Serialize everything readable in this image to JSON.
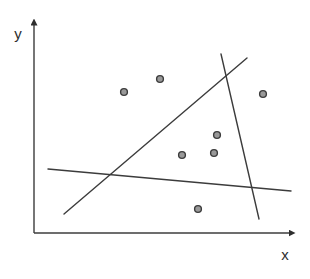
{
  "figure": {
    "background": "#ffffff",
    "line_color": "#3c3c3c",
    "line_width": 1.4,
    "axis_width": 1.4,
    "point_fill": "#999999",
    "point_stroke": "#3c3c3c",
    "point_stroke_width": 1.4,
    "point_radius": 3.4,
    "axes": {
      "x_label": "x",
      "y_label": "y",
      "origin": {
        "x": 34,
        "y": 233
      },
      "x_axis_end": {
        "x": 292,
        "y": 233
      },
      "y_axis_end": {
        "x": 34,
        "y": 22
      }
    },
    "points_px": [
      [
        124,
        92
      ],
      [
        160,
        79
      ],
      [
        263,
        94
      ],
      [
        217,
        135
      ],
      [
        182,
        155
      ],
      [
        214,
        153
      ],
      [
        198,
        209
      ]
    ],
    "lines_px": [
      {
        "name": "diagonal-line",
        "x1": 64,
        "y1": 214,
        "x2": 247,
        "y2": 58
      },
      {
        "name": "steep-line",
        "x1": 221,
        "y1": 54,
        "x2": 259,
        "y2": 219
      },
      {
        "name": "shallow-line",
        "x1": 48,
        "y1": 169,
        "x2": 291,
        "y2": 191
      }
    ]
  },
  "chart_data": {
    "type": "scatter",
    "title": "",
    "xlabel": "x",
    "ylabel": "y",
    "axis_ticks": "none",
    "legend": "none",
    "grid": false,
    "xlim": [
      0,
      1
    ],
    "ylim": [
      0,
      1
    ],
    "points": [
      {
        "x": 0.34,
        "y": 0.65
      },
      {
        "x": 0.48,
        "y": 0.71
      },
      {
        "x": 0.87,
        "y": 0.64
      },
      {
        "x": 0.7,
        "y": 0.45
      },
      {
        "x": 0.56,
        "y": 0.36
      },
      {
        "x": 0.68,
        "y": 0.37
      },
      {
        "x": 0.62,
        "y": 0.11
      }
    ],
    "overlay_lines": [
      {
        "name": "diagonal-line",
        "from": {
          "x": 0.11,
          "y": 0.09
        },
        "to": {
          "x": 0.81,
          "y": 0.81
        }
      },
      {
        "name": "steep-line",
        "from": {
          "x": 0.71,
          "y": 0.83
        },
        "to": {
          "x": 0.86,
          "y": 0.06
        }
      },
      {
        "name": "shallow-line",
        "from": {
          "x": 0.05,
          "y": 0.3
        },
        "to": {
          "x": 0.98,
          "y": 0.19
        }
      }
    ]
  }
}
